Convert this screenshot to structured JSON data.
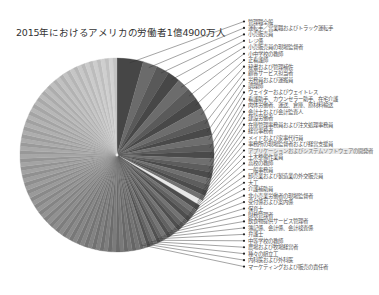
{
  "chart_data": {
    "type": "pie",
    "title": "2015年におけるアメリカの労働者1億4900万人",
    "total_workers": "1億4900万人",
    "center": [
      117,
      155
    ],
    "radius": 97,
    "labeled_categories": [
      "管理職全般",
      "運転手／営業職およびトラック運転手",
      "小売販売員",
      "レジ係",
      "小売販売員の現場監督者",
      "小中学校の教師",
      "正看護師",
      "秘書および管理補佐",
      "顧客サービス担当者",
      "労務員および運搬員",
      "調理師",
      "ウェイターおよびウェイトレス",
      "看護助手、カウンセラー助手、在宅介護",
      "肉体労働者、運送、倉庫、原材料輸送",
      "会計士および会計監査人",
      "建設労働者",
      "在庫管理事務員および注文処理事務員",
      "経営事務者",
      "メイドおよび家事代行員",
      "事務所の現場監督者および経営支援員",
      "アプリケーションおよびシステムソフトウェアの開発者",
      "土木整備作業員",
      "高校の教師",
      "一般事務員",
      "卸売業および製造業の外交販売員",
      "大工",
      "介護補助員",
      "非小売業労働者の現場監督者",
      "受付係および案内係",
      "保育士",
      "財務管理者",
      "飲食物提供サービス管理者",
      "簿記係、会計係、会計検査係",
      "弁護士",
      "中等学校の教師",
      "農場および牧場経営者",
      "種々の組立工",
      "内科医および外科医",
      "マーケティングおよび販売の責任者"
    ],
    "highlighted_category": "アプリケーションおよびシステムソフトウェアの開発者",
    "labeled_values_pct_est": [
      4.4,
      2.4,
      2.2,
      2.1,
      2.1,
      2.0,
      1.9,
      1.9,
      1.5,
      1.4,
      1.4,
      1.3,
      1.2,
      1.2,
      1.1,
      1.1,
      1.0,
      1.0,
      1.0,
      0.9,
      0.9,
      0.9,
      0.8,
      0.8,
      0.8,
      0.8,
      0.7,
      0.7,
      0.7,
      0.7,
      0.7,
      0.7,
      0.6,
      0.6,
      0.6,
      0.6,
      0.6,
      0.6,
      0.6
    ],
    "other_label": "",
    "other_pct_est": 54.3,
    "legend_position": "right",
    "colors": {
      "slice_dark": "#555555",
      "slice_light": "#c8c8c8",
      "highlight": "#e8e8e8",
      "leader_line": "#333333"
    }
  },
  "footer_text": ""
}
